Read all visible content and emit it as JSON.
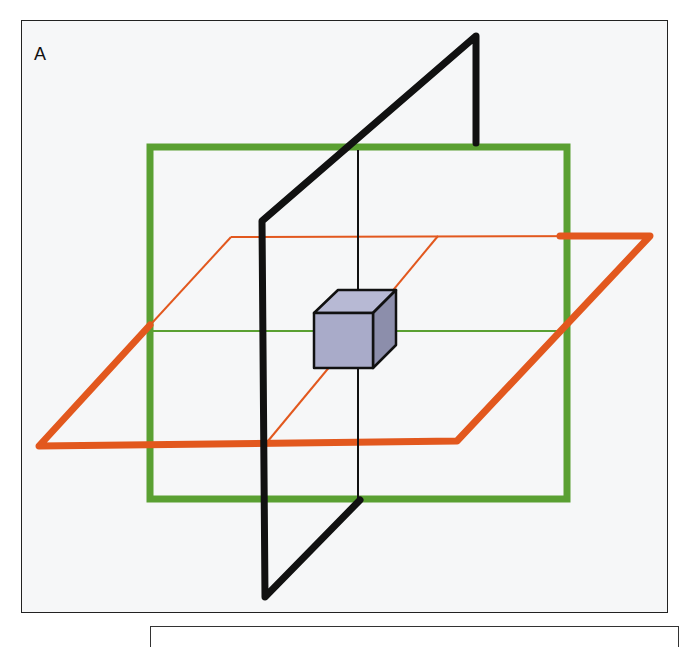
{
  "figure": {
    "panel_label": "A",
    "colors": {
      "frontal_plane": "#5aa032",
      "transverse_plane": "#e2581e",
      "sagittal_plane": "#111111",
      "cube_front": "#a9abc9",
      "cube_top": "#b7b9d4",
      "cube_side": "#8c8eab",
      "background": "#f6f7f8"
    },
    "planes": [
      {
        "name": "frontal",
        "color_key": "frontal_plane"
      },
      {
        "name": "transverse",
        "color_key": "transverse_plane"
      },
      {
        "name": "sagittal",
        "color_key": "sagittal_plane"
      }
    ]
  }
}
